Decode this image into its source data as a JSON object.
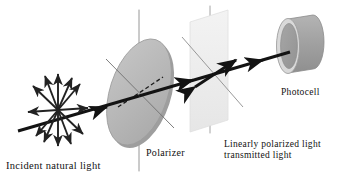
{
  "figure": {
    "background_color": "#ffffff",
    "width": 347,
    "height": 180
  },
  "labels": {
    "incident": "Incident natural light",
    "polarizer": "Polarizer",
    "transmitted_line1": "Linearly polarized light",
    "transmitted_line2": "transmitted light",
    "photocell": "Photocell"
  },
  "colors": {
    "ink": "#111111",
    "beam": "#131313",
    "disk_fill": "#b9b9b9",
    "disk_edge": "#8f8f8f",
    "disk_rim": "#9a9a9a",
    "plane_fill": "#eeeeee",
    "plane_edge": "#dcdcdc",
    "cylinder_body": "#a0a0a0",
    "cylinder_face": "#9a9a9a",
    "cylinder_rim": "#d8d8d8",
    "guide_line": "#8a8a8a",
    "axis_line": "#6f6f6f"
  },
  "components": {
    "unpolarized_burst": {
      "name": "unpolarized-light-burst",
      "center_x": 58,
      "center_y": 110,
      "ray_count": 8,
      "description": "double-headed arrows radiating in all directions"
    },
    "polarizer_disk": {
      "name": "polarizer-disk",
      "center_x": 139,
      "center_y": 92,
      "rx": 29,
      "ry": 55,
      "rotation_deg": 18
    },
    "polarization_plane": {
      "name": "polarization-plane",
      "x": 196,
      "y": 18,
      "width": 28,
      "height": 110
    },
    "photocell_cylinder": {
      "name": "photocell-cylinder",
      "center_x": 300,
      "center_y": 46,
      "rx": 11,
      "ry": 27
    },
    "beam": {
      "name": "light-beam",
      "start_x": 18,
      "start_y": 131,
      "end_x": 292,
      "end_y": 51,
      "arrow_positions": [
        105,
        190,
        262
      ]
    },
    "polarization_arrow": {
      "name": "polarization-direction-arrow",
      "x1": 196,
      "y1": 86,
      "x2": 237,
      "y2": 60
    }
  }
}
